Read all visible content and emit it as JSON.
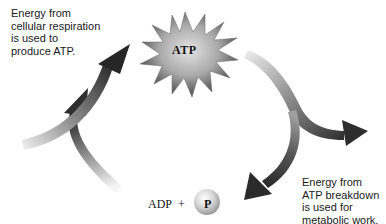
{
  "diagram": {
    "labels": {
      "top_left": "Energy from\ncellular respiration\nis used to\nproduce ATP.",
      "bottom_right": "Energy from\nATP breakdown\nis used for\nmetabolic work."
    },
    "nodes": {
      "atp": "ATP",
      "adp": "ADP",
      "plus": "+",
      "phosphate": "P"
    },
    "colors": {
      "arrow_dark": "#2e2e2e",
      "arrow_light": "#e6e6e6",
      "starburst_center": "#d8d8d8",
      "starburst_edge": "#5a5a5a",
      "phosphate_ball": "#c8c8c8",
      "text": "#1a1a1a"
    }
  }
}
